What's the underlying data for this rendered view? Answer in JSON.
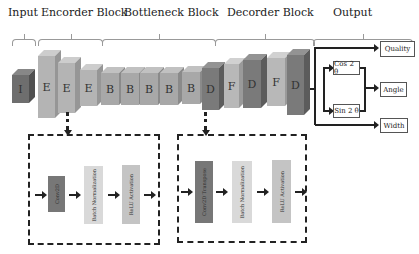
{
  "headers": {
    "input": "Input",
    "encoder": "Encorder Block",
    "bottleneck": "Bottleneck Block",
    "decoder": "Decorder Block",
    "output": "Output"
  },
  "blocks": [
    {
      "label": "I",
      "type": "input"
    },
    {
      "label": "E",
      "type": "encoder"
    },
    {
      "label": "E",
      "type": "encoder"
    },
    {
      "label": "E",
      "type": "encoder"
    },
    {
      "label": "B",
      "type": "bottleneck"
    },
    {
      "label": "B",
      "type": "bottleneck"
    },
    {
      "label": "B",
      "type": "bottleneck"
    },
    {
      "label": "B",
      "type": "bottleneck"
    },
    {
      "label": "B",
      "type": "bottleneck"
    },
    {
      "label": "D",
      "type": "decoder"
    },
    {
      "label": "F",
      "type": "fusion"
    },
    {
      "label": "D",
      "type": "decoder"
    },
    {
      "label": "F",
      "type": "fusion"
    },
    {
      "label": "D",
      "type": "decoder"
    }
  ],
  "encoder_detail": {
    "steps": [
      "Conv2D",
      "Batch Normalization",
      "ReLU Activation"
    ]
  },
  "decoder_detail": {
    "steps": [
      "Conv2D Transpose",
      "Batch Normalization",
      "ReLU Activation"
    ]
  },
  "outputs": {
    "quality": "Quality",
    "cos": "Cos 2 θ",
    "sin": "Sin 2 θ",
    "angle": "Angle",
    "width": "Width"
  },
  "colors": {
    "input": "#6e6e6e",
    "encoder": "#b4b4b4",
    "bottleneck": "#a8a8a8",
    "decoder": "#7a7a7a",
    "fusion": "#b8b8b8",
    "conv": "#777777",
    "bn": "#d9d9d9",
    "relu": "#c4c4c4"
  }
}
